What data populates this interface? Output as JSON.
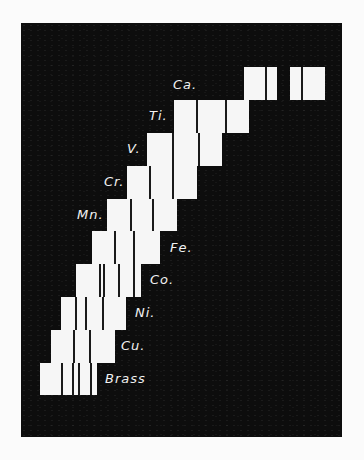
{
  "figure": {
    "rows": [
      {
        "label": "Ca.",
        "blocks": [
          {
            "x": 244,
            "w": 33,
            "lines": [
              265
            ]
          },
          {
            "x": 290,
            "w": 35,
            "lines": [
              301
            ]
          }
        ],
        "y": 67,
        "h": 33,
        "lx": 173,
        "ly": 77
      },
      {
        "label": "Ti.",
        "blocks": [
          {
            "x": 174,
            "w": 75,
            "lines": [
              196,
              225
            ]
          }
        ],
        "y": 100,
        "h": 33,
        "lx": 149,
        "ly": 108
      },
      {
        "label": "V.",
        "blocks": [
          {
            "x": 147,
            "w": 75,
            "lines": [
              172,
              198
            ]
          }
        ],
        "y": 133,
        "h": 33,
        "lx": 127,
        "ly": 141
      },
      {
        "label": "Cr.",
        "blocks": [
          {
            "x": 127,
            "w": 70,
            "lines": [
              149,
              172
            ]
          }
        ],
        "y": 166,
        "h": 33,
        "lx": 104,
        "ly": 174
      },
      {
        "label": "Mn.",
        "blocks": [
          {
            "x": 107,
            "w": 70,
            "lines": [
              130,
              152
            ]
          }
        ],
        "y": 199,
        "h": 32,
        "lx": 77,
        "ly": 207
      },
      {
        "label": "Fe.",
        "blocks": [
          {
            "x": 92,
            "w": 68,
            "lines": [
              114,
              133
            ]
          }
        ],
        "y": 231,
        "h": 33,
        "lx": 170,
        "ly": 240
      },
      {
        "label": "Co.",
        "blocks": [
          {
            "x": 76,
            "w": 65,
            "lines": [
              99,
              103,
              118,
              133
            ]
          }
        ],
        "y": 264,
        "h": 33,
        "lx": 150,
        "ly": 272
      },
      {
        "label": "Ni.",
        "blocks": [
          {
            "x": 61,
            "w": 65,
            "lines": [
              75,
              85,
              102
            ]
          }
        ],
        "y": 297,
        "h": 33,
        "lx": 135,
        "ly": 305
      },
      {
        "label": "Cu.",
        "blocks": [
          {
            "x": 51,
            "w": 64,
            "lines": [
              73,
              89
            ]
          }
        ],
        "y": 330,
        "h": 33,
        "lx": 121,
        "ly": 338
      },
      {
        "label": "Brass",
        "blocks": [
          {
            "x": 40,
            "w": 57,
            "lines": [
              61,
              72,
              78,
              90
            ]
          }
        ],
        "y": 363,
        "h": 32,
        "lx": 105,
        "ly": 371
      }
    ]
  }
}
